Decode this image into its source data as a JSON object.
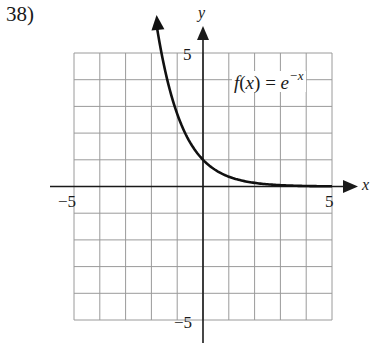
{
  "problem": {
    "number_label": "38)"
  },
  "chart_data": {
    "type": "line",
    "title": "",
    "function_label": {
      "name": "f",
      "arg": "x",
      "equals": "=",
      "base": "e",
      "exponent": "−x"
    },
    "xlabel": "x",
    "ylabel": "y",
    "xlim": [
      -5,
      5
    ],
    "ylim": [
      -5,
      5
    ],
    "grid": true,
    "grid_step": 1,
    "tick_labels": {
      "x_neg": "−5",
      "x_pos": "5",
      "y_pos": "5",
      "y_neg": "−5"
    },
    "series": [
      {
        "name": "f(x) = e^(-x)",
        "x": [
          -1.8,
          -1.5,
          -1.0,
          -0.5,
          0,
          0.5,
          1.0,
          1.5,
          2.0,
          3.0,
          4.0,
          5.0
        ],
        "y": [
          6.05,
          4.48,
          2.72,
          1.65,
          1.0,
          0.61,
          0.37,
          0.22,
          0.14,
          0.05,
          0.02,
          0.01
        ],
        "arrow_at_start": true
      }
    ],
    "axes_arrows": {
      "x_positive": true,
      "y_positive": true
    },
    "colors": {
      "grid": "#9a9a9a",
      "axis": "#1a1a1a",
      "curve": "#111111"
    }
  }
}
